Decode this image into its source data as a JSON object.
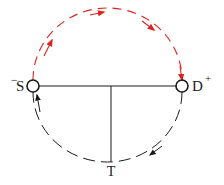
{
  "diagram": {
    "nodes": {
      "source": {
        "label": "S",
        "sign": "−",
        "cx": 33,
        "cy": 86
      },
      "drain": {
        "label": "D",
        "sign": "+",
        "cx": 182,
        "cy": 86
      },
      "junction": {
        "label": "T",
        "x": 111,
        "y": 162
      }
    },
    "edges": [
      {
        "from": "S",
        "to": "D",
        "path": "upper-arc",
        "style": "dashed",
        "color": "#e0221f",
        "direction": "clockwise"
      },
      {
        "from": "D",
        "to": "S",
        "path": "lower-arc",
        "style": "dashed",
        "color": "#1a1a1a",
        "direction": "clockwise"
      },
      {
        "from": "S",
        "to": "D",
        "path": "straight",
        "style": "solid",
        "color": "#1a1a1a"
      },
      {
        "from": "midpoint-SD",
        "to": "T",
        "path": "vertical",
        "style": "solid",
        "color": "#1a1a1a"
      }
    ],
    "colors": {
      "upper_arc": "#e0221f",
      "lower_arc": "#1a1a1a",
      "lines": "#1a1a1a"
    }
  }
}
